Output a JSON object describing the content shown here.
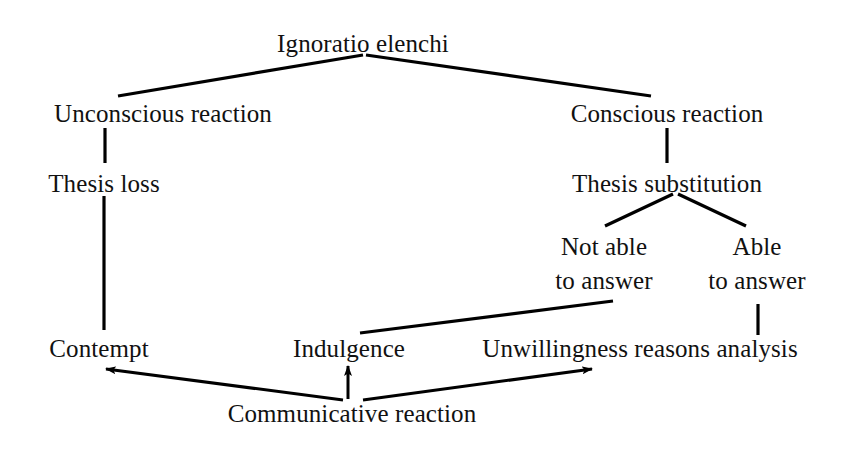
{
  "diagram": {
    "title": "Ignoratio elenchi",
    "type": "tree-diagram",
    "background_color": "#ffffff",
    "text_color": "#111111",
    "line_color": "#000000",
    "nodes": [
      {
        "id": "root",
        "label": "Ignoratio elenchi",
        "x": 363,
        "y": 30,
        "level": 0
      },
      {
        "id": "unconscious",
        "label": "Unconscious reaction",
        "x": 163,
        "y": 100,
        "level": 1
      },
      {
        "id": "conscious",
        "label": "Conscious reaction",
        "x": 667,
        "y": 100,
        "level": 1
      },
      {
        "id": "thesis-loss",
        "label": "Thesis loss",
        "x": 104,
        "y": 170,
        "level": 2
      },
      {
        "id": "thesis-subst",
        "label": "Thesis substitution",
        "x": 667,
        "y": 170,
        "level": 2
      },
      {
        "id": "not-able",
        "label": "Not able\nto answer",
        "x": 604,
        "y": 230,
        "level": 3
      },
      {
        "id": "able",
        "label": "Able\nto answer",
        "x": 757,
        "y": 230,
        "level": 3
      },
      {
        "id": "contempt",
        "label": "Contempt",
        "x": 99,
        "y": 335,
        "level": 4
      },
      {
        "id": "indulgence",
        "label": "Indulgence",
        "x": 349,
        "y": 335,
        "level": 4
      },
      {
        "id": "unwillingness",
        "label": "Unwillingness reasons analysis",
        "x": 640,
        "y": 335,
        "level": 4
      },
      {
        "id": "communicative",
        "label": "Communicative reaction",
        "x": 352,
        "y": 400,
        "level": 5
      }
    ],
    "edges": [
      {
        "id": "root-to-unconscious",
        "from": "root",
        "to": "unconscious",
        "kind": "line",
        "points": "363,55 118,96"
      },
      {
        "id": "root-to-conscious",
        "from": "root",
        "to": "conscious",
        "kind": "line",
        "points": "366,55 651,96"
      },
      {
        "id": "unconscious-to-thesis-loss",
        "from": "unconscious",
        "to": "thesis-loss",
        "kind": "line",
        "points": "105,128 105,163"
      },
      {
        "id": "conscious-to-thesis-subst",
        "from": "conscious",
        "to": "thesis-subst",
        "kind": "line",
        "points": "667,128 667,163"
      },
      {
        "id": "thesis-subst-to-not-able",
        "from": "thesis-subst",
        "to": "not-able",
        "kind": "line",
        "points": "673,194 605,226"
      },
      {
        "id": "thesis-subst-to-able",
        "from": "thesis-subst",
        "to": "able",
        "kind": "line",
        "points": "678,194 746,226"
      },
      {
        "id": "thesis-loss-to-contempt",
        "from": "thesis-loss",
        "to": "contempt",
        "kind": "line",
        "points": "104,196 104,330"
      },
      {
        "id": "not-able-to-indulgence",
        "from": "not-able",
        "to": "indulgence",
        "kind": "line",
        "points": "613,301 360,333"
      },
      {
        "id": "able-to-unwillingness",
        "from": "able",
        "to": "unwillingness",
        "kind": "line",
        "points": "758,304 758,335"
      },
      {
        "id": "communicative-to-contempt",
        "from": "communicative",
        "to": "contempt",
        "kind": "arrow",
        "points": "343,400 106,369"
      },
      {
        "id": "communicative-to-indulgence",
        "from": "communicative",
        "to": "indulgence",
        "kind": "arrow",
        "points": "348,399 348,366"
      },
      {
        "id": "communicative-to-unwilling",
        "from": "communicative",
        "to": "unwillingness",
        "kind": "arrow",
        "points": "363,400 592,369"
      }
    ]
  }
}
